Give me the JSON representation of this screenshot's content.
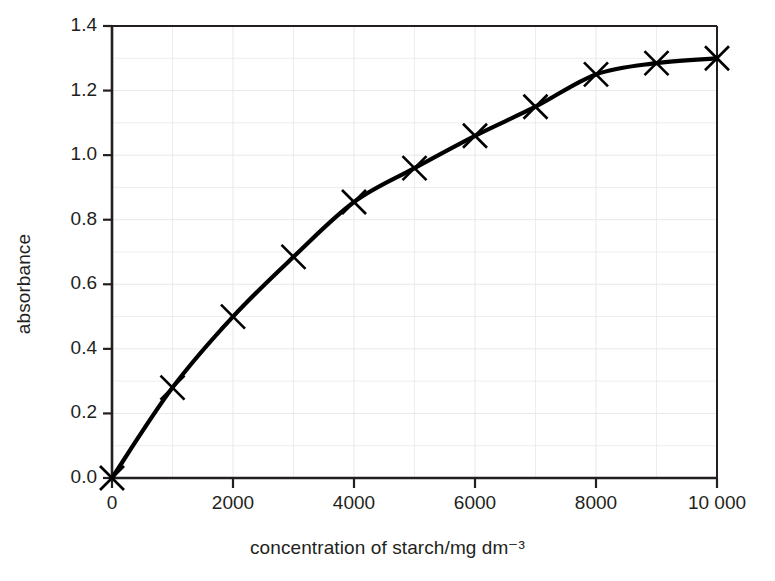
{
  "chart_data": {
    "type": "line",
    "title": "",
    "subtitle": "",
    "xlabel": "concentration of starch/mg dm⁻³",
    "ylabel": "absorbance",
    "xlim": [
      0,
      10000
    ],
    "ylim": [
      0.0,
      1.4
    ],
    "grid": true,
    "legend": "none",
    "marker": "x-cross",
    "line_style": "solid smooth thick",
    "line_color": "#000000",
    "grid_color": "#e8e8ec",
    "axis_color": "#231f20",
    "xticks": [
      0,
      2000,
      4000,
      6000,
      8000,
      10000
    ],
    "xtick_labels": [
      "0",
      "2000",
      "4000",
      "6000",
      "8000",
      "10 000"
    ],
    "yticks": [
      0.0,
      0.2,
      0.4,
      0.6,
      0.8,
      1.0,
      1.2,
      1.4
    ],
    "ytick_labels": [
      "0.0",
      "0.2",
      "0.4",
      "0.6",
      "0.8",
      "1.0",
      "1.2",
      "1.4"
    ],
    "x_minor_step": 1000,
    "y_minor_step": 0.1,
    "x": [
      0,
      1000,
      2000,
      3000,
      4000,
      5000,
      6000,
      7000,
      8000,
      9000,
      10000
    ],
    "values": [
      0.0,
      0.28,
      0.5,
      0.685,
      0.855,
      0.96,
      1.06,
      1.15,
      1.25,
      1.285,
      1.3
    ],
    "series": [
      {
        "name": "absorbance",
        "x": [
          0,
          1000,
          2000,
          3000,
          4000,
          5000,
          6000,
          7000,
          8000,
          9000,
          10000
        ],
        "values": [
          0.0,
          0.28,
          0.5,
          0.685,
          0.855,
          0.96,
          1.06,
          1.15,
          1.25,
          1.285,
          1.3
        ]
      }
    ],
    "annotations": []
  },
  "axes": {
    "x_title": "concentration of starch/mg dm⁻³",
    "y_title": "absorbance"
  }
}
